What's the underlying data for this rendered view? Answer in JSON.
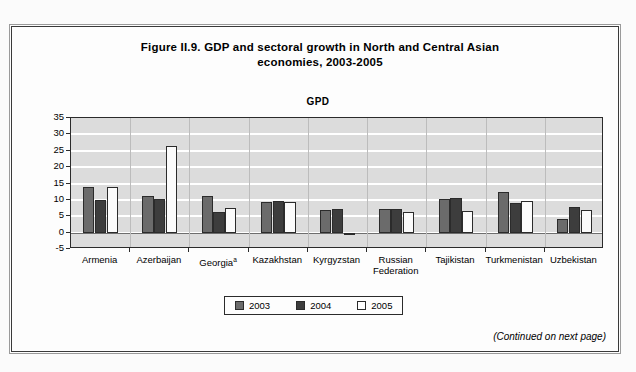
{
  "figure": {
    "title_line1": "Figure II.9.   GDP and sectoral growth in North and Central Asian",
    "title_line2": "economies, 2003-2005",
    "panel_title": "GPD",
    "footer_note": "(Continued on next page)",
    "frame_color": "#3a3a3a"
  },
  "legend": {
    "items": [
      {
        "label": "2003",
        "color": "#6b6b6b"
      },
      {
        "label": "2004",
        "color": "#3d3d3d"
      },
      {
        "label": "2005",
        "color": "#ffffff"
      }
    ]
  },
  "chart_data": {
    "type": "bar",
    "title": "GPD",
    "xlabel": "",
    "ylabel": "Percentage",
    "ylim": [
      -5,
      35
    ],
    "yticks": [
      35,
      30,
      25,
      20,
      15,
      10,
      5,
      0,
      -5
    ],
    "grid": true,
    "legend_position": "bottom",
    "plot_background": "#dcdcdc",
    "gridline_color": "#ffffff",
    "categories": [
      "Armenia",
      "Azerbaijan",
      "Georgiaᵃ",
      "Kazakhstan",
      "Kyrgyzstan",
      "Russian Federation",
      "Tajikistan",
      "Turkmenistan",
      "Uzbekistan"
    ],
    "category_labels": [
      "Armenia",
      "Azerbaijan",
      "Georgia",
      "Kazakhstan",
      "Kyrgyzstan",
      "Russian\nFederation",
      "Tajikistan",
      "Turkmenistan",
      "Uzbekistan"
    ],
    "footnote_markers": [
      "",
      "",
      "a",
      "",
      "",
      "",
      "",
      "",
      ""
    ],
    "series": [
      {
        "name": "2003",
        "color": "#6b6b6b",
        "values": [
          14.0,
          11.2,
          11.1,
          9.3,
          7.0,
          7.3,
          10.2,
          12.5,
          4.2
        ]
      },
      {
        "name": "2004",
        "color": "#3d3d3d",
        "values": [
          10.1,
          10.2,
          6.2,
          9.6,
          7.1,
          7.2,
          10.6,
          9.0,
          7.7
        ]
      },
      {
        "name": "2005",
        "color": "#ffffff",
        "values": [
          14.0,
          26.4,
          7.5,
          9.4,
          -0.6,
          6.4,
          6.7,
          9.6,
          7.0
        ]
      }
    ]
  }
}
